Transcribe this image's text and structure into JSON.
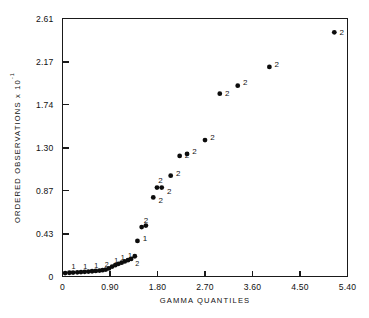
{
  "chart_data": {
    "type": "scatter",
    "title": "",
    "xlabel": "GAMMA QUANTILES",
    "ylabel": "ORDERED OBSERVATIONS",
    "ylabel_exponent": "x 10",
    "ylabel_exponent_power": "-1",
    "xlim": [
      0,
      5.4
    ],
    "ylim": [
      0,
      2.61
    ],
    "xticks": [
      0,
      0.9,
      1.8,
      2.7,
      3.6,
      4.5,
      5.4
    ],
    "xtick_labels": [
      "0",
      "0.90",
      "1.80",
      "2.70",
      "3.60",
      "4.50",
      "5.40"
    ],
    "yticks": [
      0,
      0.43,
      0.87,
      1.3,
      1.74,
      2.17,
      2.61
    ],
    "ytick_labels": [
      "0",
      "0.43",
      "0.87",
      "1.30",
      "1.74",
      "2.17",
      "2.61"
    ],
    "grid": false,
    "legend": null,
    "point_color": "#0c0c0c",
    "axis_color": "#1a1a1a",
    "points": [
      {
        "x": 0.05,
        "y": 0.035,
        "label": "",
        "lx": 0,
        "ly": 0
      },
      {
        "x": 0.13,
        "y": 0.038,
        "label": "1",
        "lx": -1,
        "ly": -5
      },
      {
        "x": 0.2,
        "y": 0.04,
        "label": "",
        "lx": 0,
        "ly": 0
      },
      {
        "x": 0.28,
        "y": 0.042,
        "label": "",
        "lx": 0,
        "ly": 0
      },
      {
        "x": 0.35,
        "y": 0.045,
        "label": "1",
        "lx": -1,
        "ly": -5
      },
      {
        "x": 0.42,
        "y": 0.047,
        "label": "",
        "lx": 0,
        "ly": 0
      },
      {
        "x": 0.49,
        "y": 0.05,
        "label": "",
        "lx": 0,
        "ly": 0
      },
      {
        "x": 0.56,
        "y": 0.053,
        "label": "1",
        "lx": -1,
        "ly": -5
      },
      {
        "x": 0.63,
        "y": 0.056,
        "label": "",
        "lx": 0,
        "ly": 0
      },
      {
        "x": 0.7,
        "y": 0.06,
        "label": "",
        "lx": 0,
        "ly": 0
      },
      {
        "x": 0.76,
        "y": 0.064,
        "label": "2",
        "lx": -1,
        "ly": -5
      },
      {
        "x": 0.82,
        "y": 0.07,
        "label": "",
        "lx": 0,
        "ly": 0
      },
      {
        "x": 0.88,
        "y": 0.082,
        "label": "",
        "lx": 0,
        "ly": 0
      },
      {
        "x": 0.94,
        "y": 0.1,
        "label": "1",
        "lx": -1,
        "ly": -5
      },
      {
        "x": 1.0,
        "y": 0.115,
        "label": "",
        "lx": 0,
        "ly": 0
      },
      {
        "x": 1.06,
        "y": 0.128,
        "label": "1",
        "lx": -1,
        "ly": -5
      },
      {
        "x": 1.12,
        "y": 0.14,
        "label": "",
        "lx": 0,
        "ly": 0
      },
      {
        "x": 1.18,
        "y": 0.152,
        "label": "1",
        "lx": 0,
        "ly": -5
      },
      {
        "x": 1.24,
        "y": 0.165,
        "label": "",
        "lx": 0,
        "ly": 0
      },
      {
        "x": 1.3,
        "y": 0.178,
        "label": "2",
        "lx": 1,
        "ly": 6
      },
      {
        "x": 1.37,
        "y": 0.205,
        "label": "",
        "lx": 0,
        "ly": 0
      },
      {
        "x": 1.42,
        "y": 0.36,
        "label": "1",
        "lx": 2,
        "ly": -1
      },
      {
        "x": 1.5,
        "y": 0.5,
        "label": "2",
        "lx": -1,
        "ly": -6
      },
      {
        "x": 1.58,
        "y": 0.515,
        "label": "",
        "lx": 0,
        "ly": 0
      },
      {
        "x": 1.72,
        "y": 0.8,
        "label": "2",
        "lx": 2,
        "ly": 4
      },
      {
        "x": 1.79,
        "y": 0.9,
        "label": "2",
        "lx": -2,
        "ly": -6
      },
      {
        "x": 1.88,
        "y": 0.9,
        "label": "2",
        "lx": 2,
        "ly": 5
      },
      {
        "x": 2.05,
        "y": 1.02,
        "label": "2",
        "lx": 2,
        "ly": -1
      },
      {
        "x": 2.22,
        "y": 1.22,
        "label": "2",
        "lx": 2,
        "ly": 1
      },
      {
        "x": 2.36,
        "y": 1.24,
        "label": "2",
        "lx": 2,
        "ly": -1
      },
      {
        "x": 2.7,
        "y": 1.38,
        "label": "2",
        "lx": 2,
        "ly": -2
      },
      {
        "x": 2.98,
        "y": 1.85,
        "label": "2",
        "lx": 2,
        "ly": 1
      },
      {
        "x": 3.32,
        "y": 1.93,
        "label": "2",
        "lx": 2,
        "ly": -2
      },
      {
        "x": 3.92,
        "y": 2.12,
        "label": "2",
        "lx": 2,
        "ly": -1
      },
      {
        "x": 5.15,
        "y": 2.47,
        "label": "2",
        "lx": 2,
        "ly": 1
      }
    ]
  }
}
